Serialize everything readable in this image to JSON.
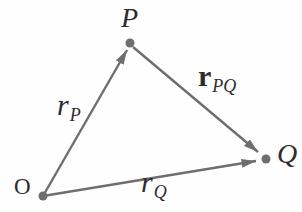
{
  "diagram": {
    "background": "#fefefe",
    "stroke_color": "#6e6e6e",
    "label_color": "#2e2c2b",
    "stroke_width": 2.4,
    "dot_radius": 4.5,
    "points": [
      {
        "id": "O",
        "label": "O",
        "x": 43,
        "y": 196,
        "label_x": 14,
        "label_y": 194,
        "italic": false,
        "font_size": 23
      },
      {
        "id": "P",
        "label": "P",
        "x": 130,
        "y": 43,
        "label_x": 121,
        "label_y": 27,
        "italic": true,
        "font_size": 28
      },
      {
        "id": "Q",
        "label": "Q",
        "x": 266,
        "y": 159,
        "label_x": 277,
        "label_y": 163,
        "italic": true,
        "font_size": 28
      }
    ],
    "vectors": [
      {
        "id": "rP",
        "x1": 43,
        "y1": 196,
        "x2": 127,
        "y2": 50,
        "label": {
          "main": "r",
          "sub": "P",
          "bold": false,
          "x": 57,
          "y": 115
        }
      },
      {
        "id": "rQ",
        "x1": 43,
        "y1": 196,
        "x2": 256,
        "y2": 161,
        "label": {
          "main": "r",
          "sub": "Q",
          "bold": false,
          "x": 141,
          "y": 192
        }
      },
      {
        "id": "rPQ",
        "x1": 133,
        "y1": 47,
        "x2": 258,
        "y2": 152,
        "label": {
          "main": "r",
          "sub": "PQ",
          "bold": true,
          "x": 198,
          "y": 86
        }
      }
    ],
    "label_font_size": 30,
    "sub_font_size": 18
  }
}
